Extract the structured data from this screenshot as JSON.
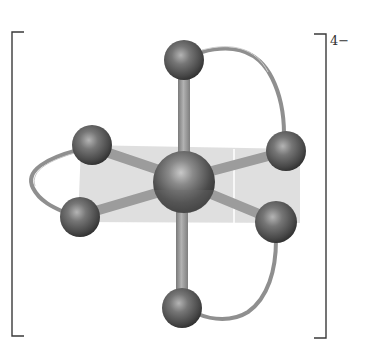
{
  "diagram": {
    "charge_label": "4−",
    "colors": {
      "bracket": "#3a3a3a",
      "plane": "#d9d9d9",
      "bond": "#9a9a9a",
      "ligand_ribbon": "#8f8f8f",
      "atom_dark": "#3c3c3c",
      "atom_light": "#a8a8a8",
      "label": "#333333"
    },
    "central_atom": {
      "x": 184,
      "y": 180,
      "r": 31
    },
    "ligand_atoms": [
      {
        "name": "top",
        "x": 184,
        "y": 60,
        "r": 20
      },
      {
        "name": "upper-left",
        "x": 92,
        "y": 145,
        "r": 20
      },
      {
        "name": "lower-left",
        "x": 80,
        "y": 217,
        "r": 20
      },
      {
        "name": "upper-right",
        "x": 286,
        "y": 151,
        "r": 20
      },
      {
        "name": "lower-right",
        "x": 276,
        "y": 222,
        "r": 21
      },
      {
        "name": "bottom",
        "x": 182,
        "y": 308,
        "r": 20
      }
    ],
    "chelate_rings": [
      {
        "name": "left-chelate",
        "connects": [
          "upper-left",
          "lower-left"
        ]
      },
      {
        "name": "right-upper-chelate",
        "connects": [
          "top",
          "upper-right"
        ]
      },
      {
        "name": "right-lower-chelate",
        "connects": [
          "lower-right",
          "bottom"
        ]
      }
    ]
  }
}
